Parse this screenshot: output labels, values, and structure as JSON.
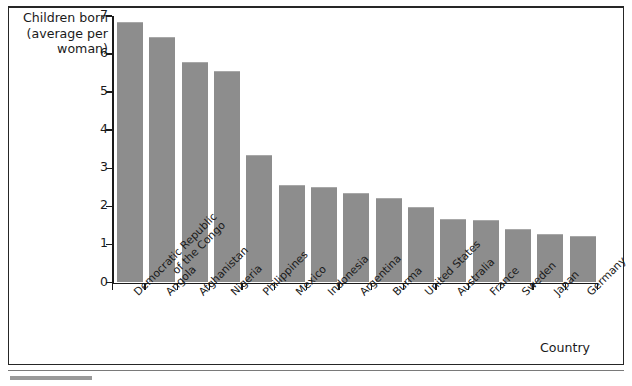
{
  "chart_data": {
    "type": "bar",
    "title": "",
    "ylabel": "Children born\n(average per\nwoman)",
    "ylabel_lines": [
      "Children born",
      "(average per",
      "woman)"
    ],
    "xlabel": "Country",
    "ylim": [
      0,
      7
    ],
    "yticks": [
      0,
      1,
      2,
      3,
      4,
      5,
      6,
      7
    ],
    "ytick_labels": [
      "0",
      "1",
      "2",
      "3",
      "4",
      "5",
      "6",
      "7"
    ],
    "grid": false,
    "legend": null,
    "bar_color": "#8d8d8d",
    "axis_color": "#1a1a1a",
    "categories": [
      "Democratic Republic\nof the Congo",
      "Angola",
      "Afghanistan",
      "Nigeria",
      "Philippines",
      "Mexico",
      "Indonesia",
      "Argentina",
      "Burma",
      "United States",
      "Australia",
      "France",
      "Sweden",
      "Japan",
      "Germany"
    ],
    "values": [
      6.85,
      6.45,
      5.78,
      5.55,
      3.35,
      2.55,
      2.5,
      2.35,
      2.22,
      1.98,
      1.68,
      1.63,
      1.4,
      1.27,
      1.23
    ]
  }
}
